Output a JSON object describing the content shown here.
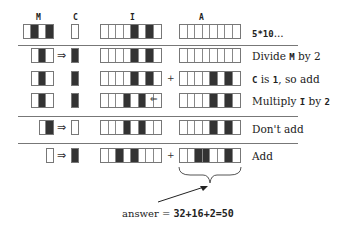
{
  "headers": {
    "m": "M",
    "c": "C",
    "i": "I",
    "a": "A"
  },
  "rows": [
    {
      "m": [
        0,
        1,
        0,
        1
      ],
      "c": [
        0
      ],
      "i": [
        0,
        0,
        0,
        0,
        1,
        0,
        1,
        0
      ],
      "a": [
        0,
        0,
        0,
        0,
        0,
        0,
        0,
        0
      ],
      "label_pre": "",
      "label_mono": "5*10",
      "label_post": "...",
      "arrow": false,
      "plus": false,
      "shift": false
    },
    {
      "m": [
        0,
        1,
        0
      ],
      "c": [
        1
      ],
      "i": [
        0,
        0,
        0,
        0,
        1,
        0,
        1,
        0
      ],
      "a": [
        0,
        0,
        0,
        0,
        0,
        0,
        0,
        0
      ],
      "label_pre": "Divide ",
      "label_mono": "M",
      "label_post": " by 2",
      "arrow": true,
      "plus": false,
      "shift": false
    },
    {
      "m": [
        0,
        1,
        0
      ],
      "c": [
        1
      ],
      "i": [
        0,
        0,
        0,
        0,
        1,
        0,
        1,
        0
      ],
      "a": [
        0,
        0,
        0,
        0,
        1,
        0,
        1,
        0
      ],
      "label_pre": "",
      "label_mono": "C",
      "label_post": " is 1, so add",
      "arrow": false,
      "plus": true,
      "shift": false
    },
    {
      "m": [
        0,
        1,
        0
      ],
      "c": [
        1
      ],
      "i": [
        0,
        0,
        0,
        1,
        0,
        1,
        0,
        0
      ],
      "a": [
        0,
        0,
        0,
        0,
        1,
        0,
        1,
        0
      ],
      "label_pre": "Multiply ",
      "label_mono": "I",
      "label_post": " by 2",
      "arrow": false,
      "plus": false,
      "shift": true
    },
    {
      "m": [
        0,
        1
      ],
      "c": [
        0
      ],
      "i": [
        0,
        0,
        0,
        1,
        0,
        1,
        0,
        0
      ],
      "a": [
        0,
        0,
        0,
        0,
        1,
        0,
        1,
        0
      ],
      "label_pre": "Don't add",
      "label_mono": "",
      "label_post": "",
      "arrow": true,
      "plus": false,
      "shift": false
    },
    {
      "m": [
        0
      ],
      "c": [
        1
      ],
      "i": [
        0,
        0,
        1,
        0,
        1,
        0,
        0,
        0
      ],
      "a": [
        0,
        0,
        1,
        1,
        0,
        0,
        1,
        0
      ],
      "label_pre": "Add",
      "label_mono": "",
      "label_post": "",
      "arrow": true,
      "plus": true,
      "shift": false
    }
  ],
  "labels": {
    "r0_mono": "5*10",
    "r0_post": "...",
    "r1_pre": "Divide ",
    "r1_mono": "M",
    "r1_post": " by 2",
    "r2_mono": "C",
    "r2_mid": " is ",
    "r2_mono2": "1",
    "r2_post": ", so add",
    "r3_pre": "Multiply ",
    "r3_mono": "I",
    "r3_mid": " by ",
    "r3_mono2": "2",
    "r4": "Don't add",
    "r5": "Add"
  },
  "symbols": {
    "implies": "⇒",
    "shift_left": "⇐",
    "plus": "+"
  },
  "answer": {
    "prefix": "answer = ",
    "expr": "32+16+2=50"
  }
}
